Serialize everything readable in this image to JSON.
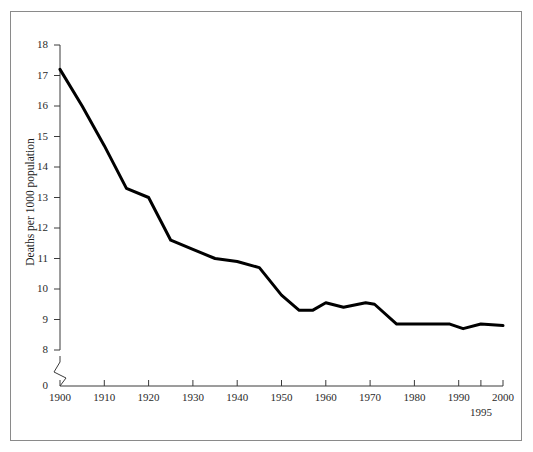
{
  "figure": {
    "frame_color": "#8a8a8a",
    "background": "#ffffff"
  },
  "axes": {
    "ylabel": "Deaths per 1000 population",
    "xlabel": "",
    "y_ticks": [
      "0",
      "8",
      "9",
      "10",
      "11",
      "12",
      "13",
      "14",
      "15",
      "16",
      "17",
      "18"
    ],
    "x_ticks": [
      "1900",
      "1910",
      "1920",
      "1930",
      "1940",
      "1950",
      "1960",
      "1970",
      "1980",
      "1990",
      "2000"
    ],
    "x_extra_tick": "1995",
    "axis_break": "y-axis-break"
  },
  "chart_data": {
    "type": "line",
    "title": "",
    "xlabel": "",
    "ylabel": "Deaths per 1000 population",
    "xlim": [
      1900,
      2000
    ],
    "ylim": [
      8,
      18
    ],
    "y_axis_break_below": 8,
    "y_zero_shown": true,
    "grid": false,
    "legend": null,
    "line_color": "#000000",
    "line_width_px": 3,
    "x": [
      1900,
      1905,
      1910,
      1915,
      1920,
      1925,
      1930,
      1935,
      1940,
      1945,
      1950,
      1954,
      1957,
      1960,
      1964,
      1969,
      1971,
      1976,
      1980,
      1985,
      1988,
      1991,
      1995,
      2000
    ],
    "y": [
      17.2,
      16.0,
      14.7,
      13.3,
      13.0,
      11.6,
      11.3,
      11.0,
      10.9,
      10.7,
      9.8,
      9.3,
      9.3,
      9.55,
      9.4,
      9.55,
      9.5,
      8.85,
      8.85,
      8.85,
      8.85,
      8.7,
      8.85,
      8.8
    ],
    "series": [
      {
        "name": "Death rate",
        "values": [
          17.2,
          16.0,
          14.7,
          13.3,
          13.0,
          11.6,
          11.3,
          11.0,
          10.9,
          10.7,
          9.8,
          9.3,
          9.3,
          9.55,
          9.4,
          9.55,
          9.5,
          8.85,
          8.85,
          8.85,
          8.85,
          8.7,
          8.85,
          8.8
        ]
      }
    ]
  }
}
